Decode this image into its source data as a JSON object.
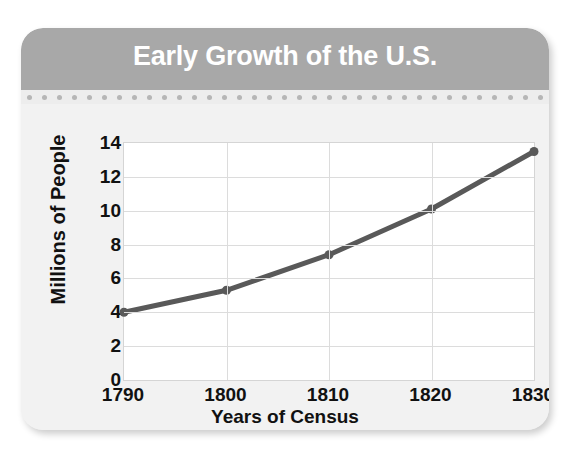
{
  "card": {
    "title": "Early Growth of the U.S.",
    "separator_dot_count": 35,
    "colors": {
      "header_bg": "#a8a8a8",
      "title_text": "#ffffff",
      "card_bg": "#f2f2f2",
      "separator_bg": "#ededed",
      "dot": "#b6b6b6",
      "plot_bg": "#ffffff",
      "gridline": "#dcdcdc",
      "series_line": "#595959",
      "axis_text": "#111111"
    }
  },
  "chart_data": {
    "type": "line",
    "title": "Early Growth of the U.S.",
    "xlabel": "Years of Census",
    "ylabel": "Millions of People",
    "x": [
      1790,
      1800,
      1810,
      1820,
      1830
    ],
    "categories": [
      "1790",
      "1800",
      "1810",
      "1820",
      "1830"
    ],
    "values": [
      4.0,
      5.3,
      7.4,
      10.1,
      13.5
    ],
    "series": [
      {
        "name": "Population",
        "values": [
          4.0,
          5.3,
          7.4,
          10.1,
          13.5
        ]
      }
    ],
    "xlim": [
      1790,
      1830
    ],
    "ylim": [
      0,
      14
    ],
    "ytick_labels": [
      "0",
      "2",
      "4",
      "6",
      "8",
      "10",
      "12",
      "14"
    ],
    "yticks": [
      0,
      2,
      4,
      6,
      8,
      10,
      12,
      14
    ],
    "xtick_labels": [
      "1790",
      "1800",
      "1810",
      "1820",
      "1830"
    ],
    "grid": true,
    "legend": false,
    "markers": true,
    "line_color": "#595959",
    "line_width": 5,
    "marker_size": 9
  }
}
